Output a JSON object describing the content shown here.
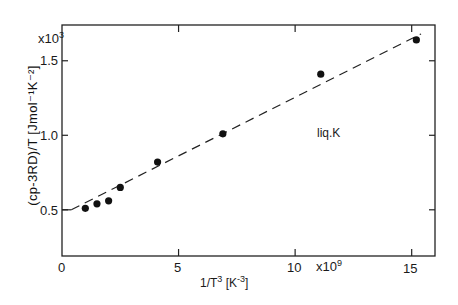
{
  "chart_data": {
    "type": "scatter",
    "title": "",
    "xlabel": "1/T^3 [K^-3]",
    "ylabel": "(cp-3RD)/T [Jmol^-1K^-2]",
    "x_multiplier": "x10^9",
    "y_multiplier": "x10^3",
    "xlim": [
      0,
      16
    ],
    "ylim": [
      0.19,
      1.74
    ],
    "x_ticks": [
      0,
      5,
      10,
      15
    ],
    "y_ticks": [
      0.5,
      1.0,
      1.5
    ],
    "grid": false,
    "annotation": "liq.K",
    "series": [
      {
        "name": "liq.K data",
        "style": "filled-circle",
        "x": [
          1.0,
          1.5,
          2.0,
          2.5,
          4.1,
          6.9,
          11.1,
          15.2
        ],
        "y": [
          0.51,
          0.54,
          0.56,
          0.65,
          0.82,
          1.01,
          1.41,
          1.64
        ]
      },
      {
        "name": "fit",
        "style": "dashed-line",
        "x": [
          0,
          0.4,
          15.4
        ],
        "y": [
          0.5,
          0.5,
          1.68
        ]
      }
    ]
  },
  "labels": {
    "x_tick_0": "0",
    "x_tick_5": "5",
    "x_tick_10": "10",
    "x_tick_15": "15",
    "x_mult": "x10",
    "x_mult_exp": "9",
    "y_tick_05": "0.5",
    "y_tick_10": "1.0",
    "y_tick_15": "1.5",
    "y_mult": "x10",
    "y_mult_exp": "3",
    "annotation": "liq.K",
    "xlabel_main": "1/T",
    "xlabel_exp": "3",
    "xlabel_unit_open": " [K",
    "xlabel_unit_exp": "-3",
    "xlabel_unit_close": "]",
    "ylabel": "(cp-3RD)/T  [Jmol⁻¹K⁻²]"
  }
}
